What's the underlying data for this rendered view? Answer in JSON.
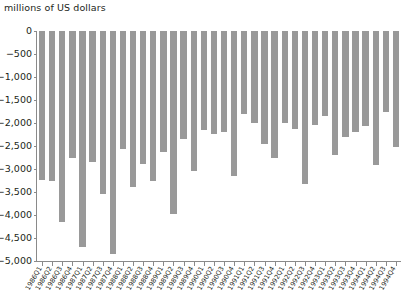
{
  "chart_data": {
    "type": "bar",
    "title": "millions of US dollars",
    "xlabel": "",
    "ylabel": "millions of US dollars",
    "ylim": [
      -5000,
      0
    ],
    "grid": false,
    "legend": "none",
    "bar_color": "#999999",
    "axis_color": "#8a8a8a",
    "text_color": "#231f20",
    "ytick_labels": [
      "0",
      "−500",
      "−1,000",
      "−1,500",
      "−2,000",
      "−2,500",
      "−3,000",
      "−3,500",
      "−4,000",
      "−4,500",
      "−5,000"
    ],
    "ytick_values": [
      0,
      -500,
      -1000,
      -1500,
      -2000,
      -2500,
      -3000,
      -3500,
      -4000,
      -4500,
      -5000
    ],
    "categories": [
      "1986Q1",
      "1986Q2",
      "1986Q3",
      "1986Q4",
      "1987Q1",
      "1987Q2",
      "1987Q3",
      "1987Q4",
      "1988Q1",
      "1988Q2",
      "1988Q3",
      "1988Q4",
      "1989Q1",
      "1989Q2",
      "1989Q3",
      "1989Q4",
      "1990Q1",
      "1990Q2",
      "1990Q3",
      "1990Q4",
      "1991Q1",
      "1991Q2",
      "1991Q3",
      "1991Q4",
      "1992Q1",
      "1992Q2",
      "1992Q3",
      "1992Q4",
      "1993Q1",
      "1993Q2",
      "1993Q3",
      "1993Q4",
      "1994Q1",
      "1994Q2",
      "1994Q3",
      "1994Q4"
    ],
    "values": [
      -3230,
      -3260,
      -4150,
      -2750,
      -4700,
      -2840,
      -3540,
      -4850,
      -2570,
      -3400,
      -2900,
      -3260,
      -2620,
      -3980,
      -2350,
      -3050,
      -2160,
      -2230,
      -2200,
      -3150,
      -1800,
      -2000,
      -2460,
      -2770,
      -2000,
      -2130,
      -3320,
      -2050,
      -1850,
      -2700,
      -2300,
      -2190,
      -2060,
      -2920,
      -1760,
      -2530
    ]
  }
}
